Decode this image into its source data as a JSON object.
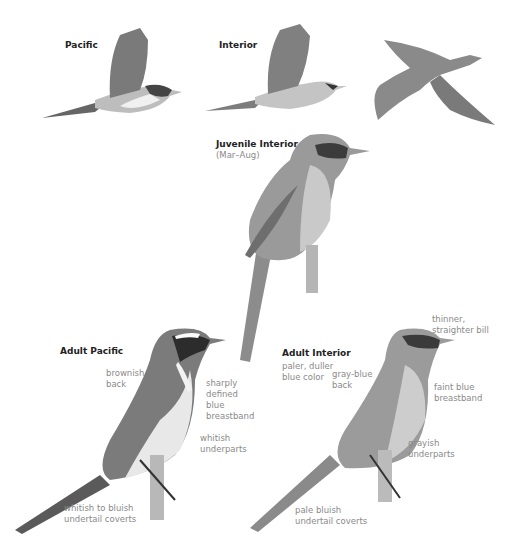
{
  "plate": {
    "top_row": [
      {
        "label": "Pacific"
      },
      {
        "label": "Interior"
      },
      {
        "label": ""
      }
    ],
    "juvenile": {
      "label": "Juvenile Interior",
      "season": "(Mar–Aug)"
    },
    "adult_pacific": {
      "label": "Adult Pacific",
      "notes": {
        "back": "brownish\nback",
        "breastband": "sharply\ndefined\nblue\nbreastband",
        "underparts": "whitish\nunderparts",
        "undertail": "whitish to bluish\nundertail coverts"
      }
    },
    "adult_interior": {
      "label": "Adult Interior",
      "notes": {
        "color": "paler, duller\nblue color",
        "back": "gray-blue\nback",
        "bill": "thinner,\nstraighter bill",
        "breastband": "faint blue\nbreastband",
        "underparts": "grayish\nunderparts",
        "undertail": "pale bluish\nundertail coverts"
      }
    }
  },
  "colors": {
    "title": "#222222",
    "note": "#8a8a8a",
    "bird_dark": "#555555",
    "bird_mid": "#8c8c8c",
    "bird_light": "#d8d8d8"
  }
}
